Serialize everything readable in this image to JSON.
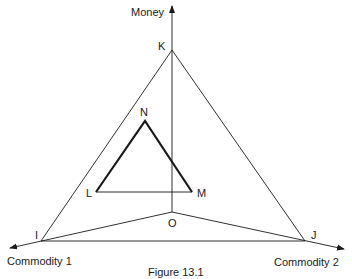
{
  "figure": {
    "caption": "Figure 13.1",
    "axes": {
      "vertical": "Money",
      "left": "Commodity 1",
      "right": "Commodity 2"
    },
    "points": {
      "K": "K",
      "I": "I",
      "J": "J",
      "O": "O",
      "N": "N",
      "L": "L",
      "M": "M"
    },
    "colors": {
      "line": "#1a1a1a",
      "background": "#ffffff"
    }
  }
}
